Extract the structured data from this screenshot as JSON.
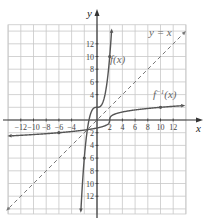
{
  "chart_data": {
    "type": "line",
    "title": "",
    "xlabel": "x",
    "ylabel": "y",
    "xlim": [
      -14,
      14
    ],
    "ylim": [
      -14.8,
      15
    ],
    "grid": true,
    "grid_step": 2,
    "x_tick_labels": [
      "−12",
      "−10",
      "−8",
      "−6",
      "−4",
      "2",
      "4",
      "6",
      "8",
      "10",
      "12"
    ],
    "x_ticks": [
      -12,
      -10,
      -8,
      -6,
      -4,
      2,
      4,
      6,
      8,
      10,
      12
    ],
    "y_tick_labels_pos": [
      "4",
      "6",
      "8",
      "10",
      "12"
    ],
    "y_ticks_pos": [
      4,
      6,
      8,
      10,
      12
    ],
    "y_tick_labels_neg": [
      "2",
      "4",
      "6",
      "8",
      "10",
      "12"
    ],
    "y_ticks_neg": [
      -2,
      -4,
      -6,
      -8,
      -10,
      -12
    ],
    "series": [
      {
        "name": "f(x)",
        "label": "f(x)",
        "formula": "x^3 + 2",
        "style": "solid",
        "marked_points": [
          [
            2,
            10
          ],
          [
            -2,
            -6
          ]
        ]
      },
      {
        "name": "f^-1(x)",
        "label": "f",
        "label_sup": "−1",
        "label_suffix": "(x)",
        "formula": "cbrt(x - 2)",
        "style": "solid",
        "marked_points": [
          [
            10,
            2
          ],
          [
            -6,
            -2
          ]
        ]
      },
      {
        "name": "y = x",
        "label": "y = x",
        "formula": "x",
        "style": "dashed"
      }
    ],
    "colors": {
      "grid": "#c8c8c8",
      "axis": "#333333",
      "curve": "#555555",
      "identity": "#777777"
    }
  }
}
